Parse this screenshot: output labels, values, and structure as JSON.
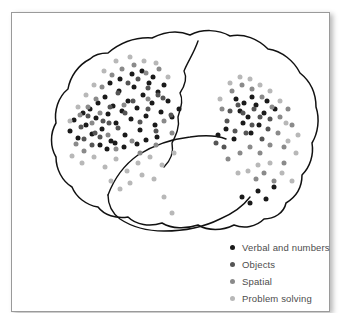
{
  "figure": {
    "type": "brain-diagram",
    "view": "lateral-left-facing",
    "frame_border_color": "#9a9a9a",
    "background_color": "#ffffff",
    "outline_color": "#111111"
  },
  "legend": {
    "position": "bottom-right",
    "text_color": "#4d4d4d",
    "items": [
      {
        "label": "Verbal and numbers",
        "color": "#1a1a1a",
        "dot": "legend-dot-verbal"
      },
      {
        "label": "Objects",
        "color": "#555555",
        "dot": "legend-dot-objects"
      },
      {
        "label": "Spatial",
        "color": "#8a8a8a",
        "dot": "legend-dot-spatial"
      },
      {
        "label": "Problem solving",
        "color": "#b8b8b8",
        "dot": "legend-dot-problem-solving"
      }
    ]
  },
  "chart_data": {
    "type": "scatter",
    "title": "",
    "xlabel": "",
    "ylabel": "",
    "grid": false,
    "legend_position": "bottom-right",
    "coordinate_space": "svg-pixels (319 x 300 figure frame)",
    "series": [
      {
        "name": "Verbal and numbers",
        "color": "#1a1a1a",
        "points": [
          [
            58,
            118
          ],
          [
            62,
            107
          ],
          [
            66,
            125
          ],
          [
            71,
            100
          ],
          [
            74,
            112
          ],
          [
            78,
            96
          ],
          [
            80,
            121
          ],
          [
            84,
            105
          ],
          [
            86,
            90
          ],
          [
            90,
            116
          ],
          [
            93,
            84
          ],
          [
            96,
            101
          ],
          [
            99,
            128
          ],
          [
            101,
            93
          ],
          [
            104,
            110
          ],
          [
            107,
            78
          ],
          [
            110,
            98
          ],
          [
            113,
            122
          ],
          [
            116,
            88
          ],
          [
            119,
            106
          ],
          [
            122,
            74
          ],
          [
            125,
            95
          ],
          [
            128,
            117
          ],
          [
            131,
            82
          ],
          [
            134,
            103
          ],
          [
            137,
            70
          ],
          [
            140,
            90
          ],
          [
            143,
            112
          ],
          [
            146,
            79
          ],
          [
            149,
            99
          ],
          [
            120,
            61
          ],
          [
            130,
            58
          ],
          [
            141,
            64
          ],
          [
            152,
            72
          ],
          [
            108,
            66
          ],
          [
            98,
            70
          ],
          [
            88,
            132
          ],
          [
            95,
            136
          ],
          [
            103,
            130
          ],
          [
            112,
            134
          ],
          [
            125,
            131
          ],
          [
            134,
            127
          ],
          [
            145,
            124
          ],
          [
            156,
            88
          ],
          [
            160,
            104
          ],
          [
            167,
            96
          ],
          [
            206,
            122
          ],
          [
            214,
            116
          ],
          [
            222,
            126
          ],
          [
            231,
            110
          ],
          [
            239,
            120
          ],
          [
            228,
            98
          ],
          [
            236,
            104
          ],
          [
            244,
            92
          ],
          [
            252,
            100
          ],
          [
            247,
            112
          ],
          [
            255,
            88
          ],
          [
            263,
            96
          ],
          [
            240,
            84
          ],
          [
            232,
            90
          ],
          [
            224,
            86
          ],
          [
            246,
            178
          ],
          [
            254,
            186
          ],
          [
            262,
            174
          ],
          [
            238,
            190
          ],
          [
            230,
            184
          ]
        ]
      },
      {
        "name": "Objects",
        "color": "#555555",
        "points": [
          [
            69,
            114
          ],
          [
            76,
            103
          ],
          [
            83,
            120
          ],
          [
            91,
            108
          ],
          [
            98,
            94
          ],
          [
            106,
            115
          ],
          [
            113,
            100
          ],
          [
            121,
            88
          ],
          [
            128,
            109
          ],
          [
            136,
            96
          ],
          [
            144,
            118
          ],
          [
            151,
            85
          ],
          [
            159,
            102
          ],
          [
            116,
            70
          ],
          [
            126,
            66
          ],
          [
            136,
            75
          ],
          [
            146,
            82
          ],
          [
            106,
            80
          ],
          [
            97,
            110
          ],
          [
            88,
            124
          ],
          [
            80,
            132
          ],
          [
            72,
            126
          ],
          [
            215,
            108
          ],
          [
            223,
            118
          ],
          [
            231,
            100
          ],
          [
            240,
            112
          ],
          [
            248,
            104
          ],
          [
            256,
            116
          ],
          [
            234,
            120
          ],
          [
            242,
            96
          ],
          [
            226,
            92
          ],
          [
            218,
            98
          ],
          [
            250,
            126
          ],
          [
            258,
            106
          ],
          [
            204,
            130
          ],
          [
            212,
            134
          ]
        ]
      },
      {
        "name": "Spatial",
        "color": "#8a8a8a",
        "points": [
          [
            64,
            131
          ],
          [
            72,
            138
          ],
          [
            80,
            110
          ],
          [
            88,
            100
          ],
          [
            96,
            122
          ],
          [
            104,
            136
          ],
          [
            112,
            92
          ],
          [
            120,
            128
          ],
          [
            128,
            140
          ],
          [
            136,
            86
          ],
          [
            144,
            132
          ],
          [
            152,
            108
          ],
          [
            160,
            120
          ],
          [
            110,
            56
          ],
          [
            122,
            52
          ],
          [
            134,
            60
          ],
          [
            147,
            56
          ],
          [
            100,
            62
          ],
          [
            90,
            74
          ],
          [
            84,
            86
          ],
          [
            76,
            94
          ],
          [
            68,
            102
          ],
          [
            210,
            96
          ],
          [
            220,
            78
          ],
          [
            230,
            72
          ],
          [
            240,
            76
          ],
          [
            250,
            84
          ],
          [
            260,
            94
          ],
          [
            268,
            104
          ],
          [
            258,
            132
          ],
          [
            248,
            140
          ],
          [
            238,
            134
          ],
          [
            266,
            120
          ],
          [
            272,
            134
          ],
          [
            228,
            140
          ],
          [
            216,
            146
          ],
          [
            252,
            160
          ],
          [
            262,
            168
          ],
          [
            244,
            166
          ],
          [
            272,
            150
          ],
          [
            280,
            112
          ],
          [
            276,
            96
          ]
        ]
      },
      {
        "name": "Problem solving",
        "color": "#b8b8b8",
        "points": [
          [
            60,
            143
          ],
          [
            70,
            150
          ],
          [
            82,
            144
          ],
          [
            93,
            154
          ],
          [
            104,
            146
          ],
          [
            115,
            158
          ],
          [
            126,
            150
          ],
          [
            138,
            144
          ],
          [
            150,
            152
          ],
          [
            162,
            140
          ],
          [
            104,
            48
          ],
          [
            118,
            44
          ],
          [
            132,
            48
          ],
          [
            144,
            50
          ],
          [
            156,
            64
          ],
          [
            92,
            58
          ],
          [
            82,
            72
          ],
          [
            74,
            82
          ],
          [
            66,
            94
          ],
          [
            58,
            108
          ],
          [
            99,
            168
          ],
          [
            108,
            176
          ],
          [
            118,
            170
          ],
          [
            130,
            162
          ],
          [
            142,
            166
          ],
          [
            208,
            86
          ],
          [
            218,
            70
          ],
          [
            228,
            64
          ],
          [
            238,
            66
          ],
          [
            248,
            72
          ],
          [
            258,
            78
          ],
          [
            268,
            88
          ],
          [
            276,
            128
          ],
          [
            284,
            140
          ],
          [
            270,
            160
          ],
          [
            280,
            168
          ],
          [
            258,
            150
          ],
          [
            246,
            152
          ],
          [
            236,
            158
          ],
          [
            226,
            160
          ],
          [
            286,
            122
          ],
          [
            274,
            110
          ],
          [
            152,
            184
          ],
          [
            160,
            200
          ]
        ]
      }
    ]
  }
}
